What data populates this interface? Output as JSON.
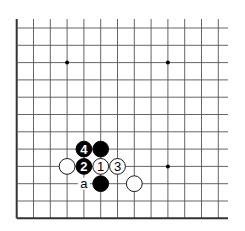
{
  "diagram": {
    "type": "go-board-fragment",
    "colors": {
      "background": "#ffffff",
      "line": "#555555",
      "edge": "#333333",
      "black": "#000000",
      "white": "#ffffff"
    },
    "grid": {
      "origin_x": 16.7,
      "origin_y": 28,
      "spacing_x": 16.8,
      "spacing_y": 17.3,
      "cols": 13,
      "rows": 12,
      "top_extend": 19,
      "right_extend": 228
    },
    "edges": [
      "left",
      "bottom"
    ],
    "star_points": [
      {
        "col": 3,
        "row": 2
      },
      {
        "col": 9,
        "row": 2
      },
      {
        "col": 9,
        "row": 8
      }
    ],
    "stones": [
      {
        "col": 4,
        "row": 7,
        "color": "black",
        "label": "4"
      },
      {
        "col": 5,
        "row": 7,
        "color": "black",
        "label": ""
      },
      {
        "col": 3,
        "row": 8,
        "color": "white",
        "label": ""
      },
      {
        "col": 4,
        "row": 8,
        "color": "black",
        "label": "2"
      },
      {
        "col": 5,
        "row": 8,
        "color": "white",
        "label": "1"
      },
      {
        "col": 6,
        "row": 8,
        "color": "white",
        "label": "3"
      },
      {
        "col": 5,
        "row": 9,
        "color": "black",
        "label": ""
      },
      {
        "col": 7,
        "row": 9,
        "color": "white",
        "label": ""
      }
    ],
    "markers": [
      {
        "col": 4,
        "row": 9,
        "label": "a"
      }
    ]
  }
}
